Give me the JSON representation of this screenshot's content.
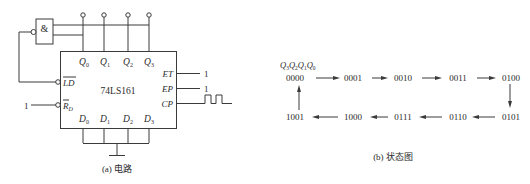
{
  "circuit": {
    "chip_name": "74LS161",
    "gate_label": "&",
    "q_outputs": [
      {
        "base": "Q",
        "sub": "0"
      },
      {
        "base": "Q",
        "sub": "1"
      },
      {
        "base": "Q",
        "sub": "2"
      },
      {
        "base": "Q",
        "sub": "3"
      }
    ],
    "d_inputs": [
      {
        "base": "D",
        "sub": "0"
      },
      {
        "base": "D",
        "sub": "1"
      },
      {
        "base": "D",
        "sub": "2"
      },
      {
        "base": "D",
        "sub": "3"
      }
    ],
    "pins_left": {
      "ld": "LD",
      "rd_base": "R",
      "rd_sub": "D",
      "rd_value": "1"
    },
    "pins_right": {
      "et": "ET",
      "ep": "EP",
      "cp": "CP",
      "et_value": "1",
      "ep_value": "1"
    },
    "caption": "(a) 电路"
  },
  "state_diagram": {
    "header": {
      "base": "Q",
      "subs": [
        "3",
        "2",
        "1",
        "0"
      ]
    },
    "top_row": [
      "0000",
      "0001",
      "0010",
      "0011",
      "0100"
    ],
    "bottom_row": [
      "1001",
      "1000",
      "0111",
      "0110",
      "0101"
    ],
    "caption": "(b) 状态图"
  }
}
